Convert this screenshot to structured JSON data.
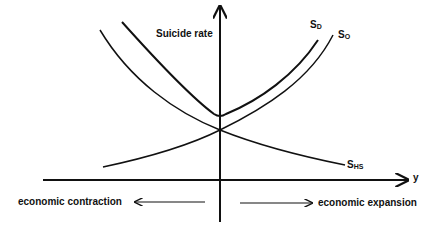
{
  "diagram": {
    "y_axis_label": "Suicide rate",
    "x_axis_label": "y",
    "curves": [
      {
        "id": "upper",
        "label": "S",
        "subscript": "D",
        "description": "total suicide rate, U-shaped with minimum at origin"
      },
      {
        "id": "rising",
        "label": "S",
        "subscript": "O",
        "description": "rising with economic expansion"
      },
      {
        "id": "falling",
        "label": "S",
        "subscript": "HS",
        "description": "falling with economic expansion"
      }
    ],
    "left_annotation": "economic contraction",
    "right_annotation": "economic expansion",
    "colors": {
      "ink": "#111111",
      "background": "#ffffff"
    }
  }
}
